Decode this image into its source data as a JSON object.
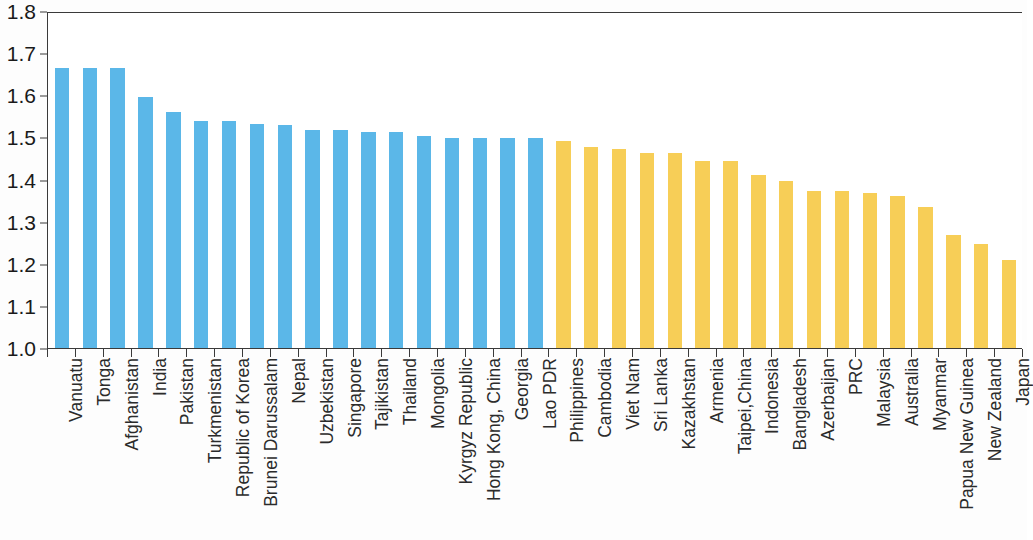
{
  "chart_data": {
    "type": "bar",
    "title": "",
    "subtitle": "",
    "xlabel": "",
    "ylabel": "",
    "ylim": [
      1.0,
      1.8
    ],
    "ytick_labels": [
      "1.8",
      "1.7",
      "1.6",
      "1.5",
      "1.4",
      "1.3",
      "1.2",
      "1.1",
      "1.0"
    ],
    "ytick_values": [
      1.8,
      1.7,
      1.6,
      1.5,
      1.4,
      1.3,
      1.2,
      1.1,
      1.0
    ],
    "grid": false,
    "legend": null,
    "legend_position": "none",
    "categories": [
      "Vanuatu",
      "Tonga",
      "Afghanistan",
      "India",
      "Pakistan",
      "Turkmenistan",
      "Republic of Korea",
      "Brunei Darussalam",
      "Nepal",
      "Uzbekistan",
      "Singapore",
      "Tajikistan",
      "Thailand",
      "Mongolia",
      "Kyrgyz Republic",
      "Hong Kong, China",
      "Georgia",
      "Lao PDR",
      "Philippines",
      "Cambodia",
      "Viet Nam",
      "Sri Lanka",
      "Kazakhstan",
      "Armenia",
      "Taipei,China",
      "Indonesia",
      "Bangladesh",
      "Azerbaijan",
      "PRC",
      "Malaysia",
      "Australia",
      "Myanmar",
      "Papua New Guinea",
      "New Zealand",
      "Japan"
    ],
    "values": [
      1.665,
      1.665,
      1.665,
      1.595,
      1.56,
      1.54,
      1.54,
      1.532,
      1.53,
      1.517,
      1.517,
      1.512,
      1.512,
      1.503,
      1.498,
      1.498,
      1.498,
      1.498,
      1.492,
      1.477,
      1.472,
      1.463,
      1.463,
      1.444,
      1.443,
      1.41,
      1.396,
      1.372,
      1.372,
      1.367,
      1.362,
      1.335,
      1.268,
      1.248,
      1.208
    ],
    "colors": [
      "#5BB7E8",
      "#5BB7E8",
      "#5BB7E8",
      "#5BB7E8",
      "#5BB7E8",
      "#5BB7E8",
      "#5BB7E8",
      "#5BB7E8",
      "#5BB7E8",
      "#5BB7E8",
      "#5BB7E8",
      "#5BB7E8",
      "#5BB7E8",
      "#5BB7E8",
      "#5BB7E8",
      "#5BB7E8",
      "#5BB7E8",
      "#5BB7E8",
      "#F7CE57",
      "#F7CE57",
      "#F7CE57",
      "#F7CE57",
      "#F7CE57",
      "#F7CE57",
      "#F7CE57",
      "#F7CE57",
      "#F7CE57",
      "#F7CE57",
      "#F7CE57",
      "#F7CE57",
      "#F7CE57",
      "#F7CE57",
      "#F7CE57",
      "#F7CE57",
      "#F7CE57"
    ],
    "series_colors": {
      "blue": "#5BB7E8",
      "orange": "#F7CE57"
    },
    "axis_color": "#3a3a3a",
    "background": "#ffffff"
  }
}
